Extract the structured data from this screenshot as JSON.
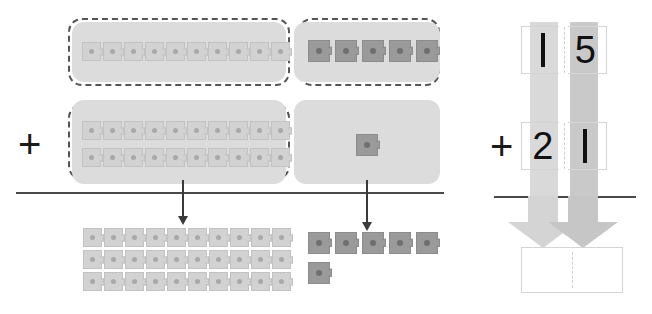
{
  "worksheet": {
    "title": "Base-ten blocks addition model",
    "operator": "+",
    "operator_right": "+"
  },
  "colors": {
    "unit_light": "#d2d2d2",
    "unit_dark": "#9a9a9a",
    "platter": "#dcdcdc",
    "dashed_border": "#555555",
    "rule": "#4a4a4a",
    "band_tens": "#d9d9d9",
    "band_ones": "#c9c9c9",
    "digit": "#111111",
    "answer_border": "#d5d5d5"
  },
  "model": {
    "tens_group": {
      "label": "tens-column-group",
      "addend_one": {
        "rows": 1,
        "units_per_row": 10,
        "total": 10
      },
      "addend_two": {
        "rows": 2,
        "units_per_row": 10,
        "total": 20
      }
    },
    "ones_group": {
      "label": "ones-column-group",
      "addend_one": {
        "rows": 1,
        "units_per_row": 5,
        "total": 5
      },
      "addend_two": {
        "rows": 1,
        "units_per_row": 1,
        "total": 1
      }
    },
    "result": {
      "tens": {
        "rows": 3,
        "units_per_row": 10,
        "total": 30
      },
      "ones": {
        "row_one": 5,
        "row_two": 1,
        "total": 6
      }
    }
  },
  "place_value": {
    "column_headers": [
      "tens",
      "ones"
    ],
    "addend_one": {
      "tens": "1",
      "ones": "5",
      "value": "15"
    },
    "addend_two": {
      "tens": "2",
      "ones": "1",
      "value": "21"
    },
    "answer": {
      "tens": "",
      "ones": "",
      "value": ""
    }
  },
  "icons": {
    "down_arrow_tens": "down-arrow-icon",
    "down_arrow_ones": "down-arrow-icon",
    "fat_arrow_tens": "fat-down-arrow-icon",
    "fat_arrow_ones": "fat-down-arrow-icon"
  }
}
